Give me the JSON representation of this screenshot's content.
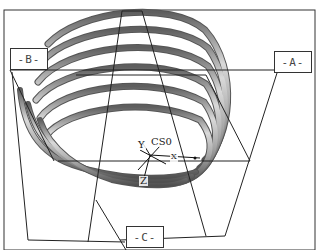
{
  "viewport": {
    "model": "helical spring",
    "background": "#ffffff",
    "frame_color": "#333333",
    "coil_color": "#9a9a9a",
    "coil_highlight": "#d8d8d8",
    "coil_shadow": "#5a5a5a"
  },
  "datum_planes": [
    {
      "id": "A",
      "label": "-A-"
    },
    {
      "id": "B",
      "label": "-B-"
    },
    {
      "id": "C",
      "label": "-C-"
    }
  ],
  "coordinate_system": {
    "name": "CS0",
    "axes": {
      "x": "X",
      "y": "Y",
      "z": "Z"
    }
  }
}
